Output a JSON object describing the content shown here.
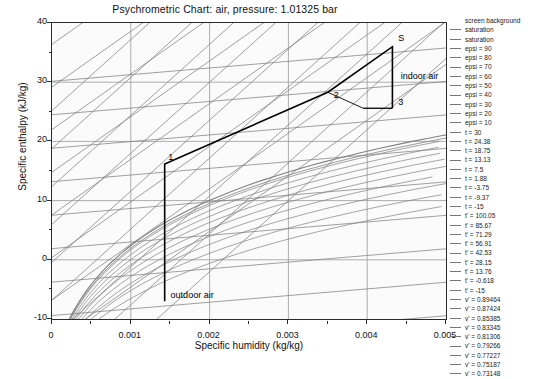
{
  "chart_data": {
    "type": "line",
    "title": "Psychrometric Chart: air, pressure: 1.01325 bar",
    "xlabel": "Specific humidity (kg/kg)",
    "ylabel": "Specific enthalpy (kJ/kg)",
    "xlim": [
      0,
      0.005
    ],
    "ylim": [
      -10,
      40
    ],
    "xticks": [
      "0",
      "0.001",
      "0.002",
      "0.003",
      "0.004",
      "0.005"
    ],
    "xtick_values": [
      0,
      0.001,
      0.002,
      0.003,
      0.004,
      0.005
    ],
    "yticks": [
      "40",
      "30",
      "20",
      "10",
      "0",
      "-10"
    ],
    "ytick_values": [
      40,
      30,
      20,
      10,
      0,
      -10
    ],
    "grid": true,
    "legend_position": "right",
    "annotations": [
      {
        "text": "1",
        "x": 0.00145,
        "y": 17.2
      },
      {
        "text": "2",
        "x": 0.00355,
        "y": 27.6
      },
      {
        "text": "3",
        "x": 0.00437,
        "y": 26.5
      },
      {
        "text": "S",
        "x": 0.00437,
        "y": 37.3
      },
      {
        "text": "indoor air",
        "x": 0.0044,
        "y": 30.9
      },
      {
        "text": "outdoor air",
        "x": 0.00148,
        "y": -6.1
      }
    ],
    "process_path": {
      "name": "air-conditioning process",
      "points": [
        {
          "label": "outdoor air",
          "x": 0.00143,
          "y": -7.0
        },
        {
          "label": "1",
          "x": 0.00143,
          "y": 16.2
        },
        {
          "label": "2",
          "x": 0.0035,
          "y": 28.3
        },
        {
          "label": "S",
          "x": 0.00432,
          "y": 36.0
        },
        {
          "label": "3",
          "x": 0.00432,
          "y": 25.6
        }
      ]
    },
    "series": [
      {
        "name": "screen background",
        "kind": "background"
      },
      {
        "name": "saturation",
        "kind": "saturation"
      },
      {
        "name": "saturation",
        "kind": "saturation"
      },
      {
        "name": "epsi = 90",
        "kind": "epsi",
        "value": 90
      },
      {
        "name": "epsi = 80",
        "kind": "epsi",
        "value": 80
      },
      {
        "name": "epsi = 70",
        "kind": "epsi",
        "value": 70
      },
      {
        "name": "epsi = 60",
        "kind": "epsi",
        "value": 60
      },
      {
        "name": "epsi = 50",
        "kind": "epsi",
        "value": 50
      },
      {
        "name": "epsi = 40",
        "kind": "epsi",
        "value": 40
      },
      {
        "name": "epsi = 30",
        "kind": "epsi",
        "value": 30
      },
      {
        "name": "epsi = 20",
        "kind": "epsi",
        "value": 20
      },
      {
        "name": "epsi = 10",
        "kind": "epsi",
        "value": 10
      },
      {
        "name": "t = 30",
        "kind": "t",
        "value": 30
      },
      {
        "name": "t = 24.38",
        "kind": "t",
        "value": 24.38
      },
      {
        "name": "t = 18.75",
        "kind": "t",
        "value": 18.75
      },
      {
        "name": "t = 13.13",
        "kind": "t",
        "value": 13.13
      },
      {
        "name": "t = 7.5",
        "kind": "t",
        "value": 7.5
      },
      {
        "name": "t = 1.88",
        "kind": "t",
        "value": 1.88
      },
      {
        "name": "t = -3.75",
        "kind": "t",
        "value": -3.75
      },
      {
        "name": "t = -9.37",
        "kind": "t",
        "value": -9.37
      },
      {
        "name": "t = -15",
        "kind": "t",
        "value": -15
      },
      {
        "name": "t' = 100.05",
        "kind": "twet",
        "value": 100.05
      },
      {
        "name": "t' = 85.67",
        "kind": "twet",
        "value": 85.67
      },
      {
        "name": "t' = 71.29",
        "kind": "twet",
        "value": 71.29
      },
      {
        "name": "t' = 56.91",
        "kind": "twet",
        "value": 56.91
      },
      {
        "name": "t' = 42.53",
        "kind": "twet",
        "value": 42.53
      },
      {
        "name": "t' = 28.15",
        "kind": "twet",
        "value": 28.15
      },
      {
        "name": "t' = 13.76",
        "kind": "twet",
        "value": 13.76
      },
      {
        "name": "t' = -0.618",
        "kind": "twet",
        "value": -0.618
      },
      {
        "name": "t' = -15",
        "kind": "twet",
        "value": -15
      },
      {
        "name": "v' = 0.89464",
        "kind": "v",
        "value": 0.89464
      },
      {
        "name": "v' = 0.87424",
        "kind": "v",
        "value": 0.87424
      },
      {
        "name": "v' = 0.85385",
        "kind": "v",
        "value": 0.85385
      },
      {
        "name": "v' = 0.83345",
        "kind": "v",
        "value": 0.83345
      },
      {
        "name": "v' = 0.81306",
        "kind": "v",
        "value": 0.81306
      },
      {
        "name": "v' = 0.79266",
        "kind": "v",
        "value": 0.79266
      },
      {
        "name": "v' = 0.77227",
        "kind": "v",
        "value": 0.77227
      },
      {
        "name": "v' = 0.75187",
        "kind": "v",
        "value": 0.75187
      },
      {
        "name": "v' = 0.73148",
        "kind": "v",
        "value": 0.73148
      }
    ]
  },
  "legend": {
    "entries": [
      "screen background",
      "saturation",
      "saturation",
      "epsi = 90",
      "epsi = 80",
      "epsi = 70",
      "epsi = 60",
      "epsi = 50",
      "epsi = 40",
      "epsi = 30",
      "epsi = 20",
      "epsi = 10",
      "t = 30",
      "t = 24.38",
      "t = 18.75",
      "t = 13.13",
      "t = 7.5",
      "t = 1.88",
      "t = -3.75",
      "t = -9.37",
      "t = -15",
      "t' = 100.05",
      "t' = 85.67",
      "t' = 71.29",
      "t' = 56.91",
      "t' = 42.53",
      "t' = 28.15",
      "t' = 13.76",
      "t' = -0.618",
      "t' = -15",
      "v' = 0.89464",
      "v' = 0.87424",
      "v' = 0.85385",
      "v' = 0.83345",
      "v' = 0.81306",
      "v' = 0.79266",
      "v' = 0.77227",
      "v' = 0.75187",
      "v' = 0.73148"
    ]
  },
  "colors": {
    "grid": "#999999",
    "axis": "#2b2b2b",
    "curve": "#808080",
    "process": "#000000",
    "background": "#fbfbfb"
  }
}
